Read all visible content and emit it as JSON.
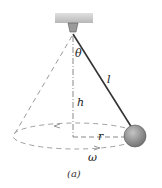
{
  "diagram": {
    "labels": {
      "theta": "θ",
      "length": "l",
      "height": "h",
      "radius": "r",
      "omega": "ω"
    },
    "caption": "(a)",
    "colors": {
      "ceiling": "#c8c8c8",
      "string": "#333333",
      "bob": "#8a8a8a",
      "dashes": "#9a9a9a"
    }
  }
}
